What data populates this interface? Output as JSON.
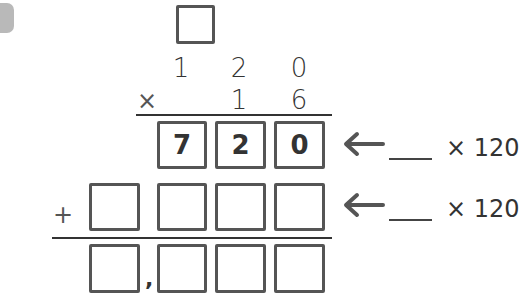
{
  "problem": {
    "badge_color": "#b9b9b9",
    "carry_box": "",
    "multiplicand": [
      "1",
      "2",
      "0"
    ],
    "multiplier": [
      "1",
      "6"
    ],
    "times_symbol": "×",
    "plus_symbol": "+",
    "partial_product_1": [
      "7",
      "2",
      "0"
    ],
    "partial_product_2": [
      "",
      "",
      "",
      ""
    ],
    "result": [
      "",
      "",
      "",
      ""
    ],
    "thousands_separator": ",",
    "annotations": [
      {
        "blank": "",
        "label": "× 120"
      },
      {
        "blank": "",
        "label": "× 120"
      }
    ]
  }
}
